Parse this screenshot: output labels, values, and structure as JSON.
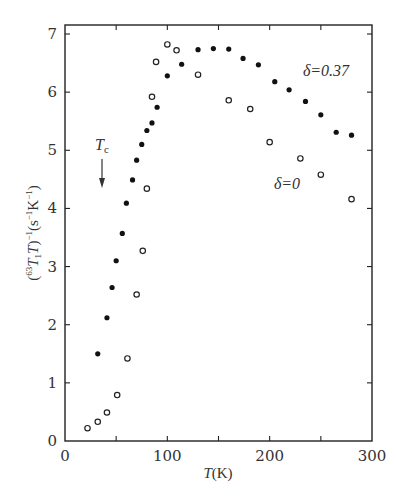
{
  "chart_data": {
    "type": "scatter",
    "title": "",
    "xlabel": "T(K)",
    "ylabel": "(63T1T)^-1 (s^-1 K^-1)",
    "xlim": [
      0,
      300
    ],
    "ylim": [
      0,
      7
    ],
    "x_ticks": [
      0,
      100,
      200,
      300
    ],
    "x_minor_ticks": [
      50,
      150,
      250
    ],
    "y_ticks": [
      0,
      1,
      2,
      3,
      4,
      5,
      6,
      7
    ],
    "grid": false,
    "legend": "none (inline annotations)",
    "series": [
      {
        "name": "δ=0.37",
        "marker": "filled-circle",
        "x": [
          32,
          41,
          46,
          50,
          56,
          60,
          66,
          70,
          75,
          80,
          85,
          90,
          100,
          114,
          130,
          145,
          160,
          174,
          189,
          205,
          219,
          235,
          250,
          265,
          280
        ],
        "y": [
          1.5,
          2.12,
          2.64,
          3.1,
          3.57,
          4.09,
          4.49,
          4.83,
          5.1,
          5.34,
          5.47,
          5.74,
          6.28,
          6.48,
          6.73,
          6.75,
          6.74,
          6.58,
          6.47,
          6.18,
          6.04,
          5.84,
          5.61,
          5.31,
          5.26
        ]
      },
      {
        "name": "δ=0",
        "marker": "open-circle",
        "x": [
          22,
          32,
          41,
          51,
          61,
          70,
          76,
          80,
          85,
          89,
          100,
          109,
          130,
          160,
          181,
          200,
          230,
          250,
          280
        ],
        "y": [
          0.22,
          0.33,
          0.49,
          0.79,
          1.42,
          2.52,
          3.27,
          4.34,
          5.92,
          6.52,
          6.82,
          6.72,
          6.3,
          5.86,
          5.71,
          5.14,
          4.86,
          4.58,
          4.16
        ]
      }
    ],
    "annotations": [
      {
        "text": "δ=0.37",
        "x": 218,
        "y": 6.35
      },
      {
        "text": "δ=0",
        "x": 195,
        "y": 4.42
      },
      {
        "text": "Tc",
        "label_x": 60,
        "label_y": 5.38,
        "arrow_from_y": 5.2,
        "arrow_to_y": 4.72,
        "arrow_x": 61
      }
    ]
  },
  "axes": {
    "xlabel_main": "T",
    "xlabel_unit": "(K)",
    "ylabel_parts": {
      "open": "(",
      "sup63": "63",
      "T1": "T",
      "sub1": "1",
      "T": "T",
      "close_inv": ")",
      "inv": "−1",
      "unit_open": "(s",
      "s_inv": "−1",
      "K": "K",
      "K_inv": "−1",
      "unit_close": ")"
    }
  },
  "labels": {
    "delta037": "δ=0.37",
    "delta0": "δ=0",
    "tc_main": "T",
    "tc_sub": "c"
  }
}
